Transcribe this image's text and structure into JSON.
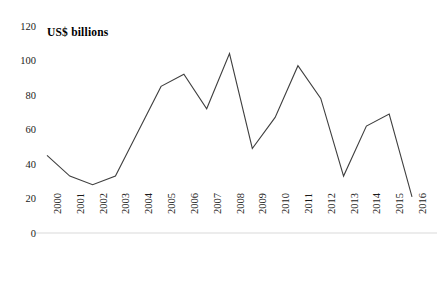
{
  "chart_data": {
    "type": "line",
    "title": "US$ billions",
    "xlabel": "",
    "ylabel": "",
    "ylim": [
      0,
      120
    ],
    "yticks": [
      0,
      20,
      40,
      60,
      80,
      100,
      120
    ],
    "grid": false,
    "legend": "none",
    "line_color": "#3f3f3f",
    "axis_color": "#d9d9d9",
    "categories": [
      "2000",
      "2001",
      "2002",
      "2003",
      "2004",
      "2005",
      "2006",
      "2007",
      "2008",
      "2009",
      "2010",
      "2011",
      "2012",
      "2013",
      "2014",
      "2015",
      "2016"
    ],
    "values": [
      45,
      33,
      28,
      33,
      59,
      85,
      92,
      72,
      104,
      49,
      67,
      97,
      78,
      33,
      62,
      69,
      21
    ]
  }
}
